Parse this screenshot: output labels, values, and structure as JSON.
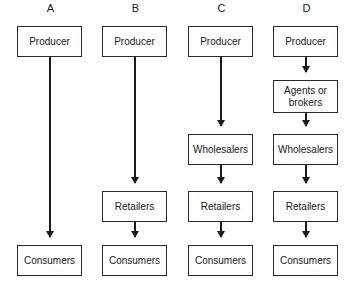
{
  "diagram": {
    "type": "distribution-channels",
    "channels": [
      {
        "label": "A",
        "nodes": [
          "Producer",
          "Consumers"
        ]
      },
      {
        "label": "B",
        "nodes": [
          "Producer",
          "Retailers",
          "Consumers"
        ]
      },
      {
        "label": "C",
        "nodes": [
          "Producer",
          "Wholesalers",
          "Retailers",
          "Consumers"
        ]
      },
      {
        "label": "D",
        "nodes": [
          "Producer",
          "Agents or brokers",
          "Wholesalers",
          "Retailers",
          "Consumers"
        ]
      }
    ],
    "colors": {
      "line": "#1a1a1a",
      "box_border": "#2a2a2a",
      "background": "#ffffff"
    }
  }
}
